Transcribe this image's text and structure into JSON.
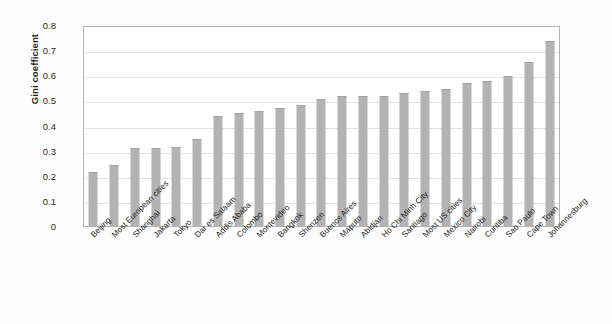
{
  "chart_data": {
    "type": "bar",
    "title": "",
    "xlabel": "",
    "ylabel": "Gini coefficient",
    "ylim": [
      0,
      0.8
    ],
    "ytick_labels": [
      "0.8",
      "0.7",
      "0.6",
      "0.5",
      "0.4",
      "0.3",
      "0.2",
      "0.1",
      "0"
    ],
    "ytick_values": [
      0.8,
      0.7,
      0.6,
      0.5,
      0.4,
      0.3,
      0.2,
      0.1,
      0
    ],
    "grid": true,
    "legend": null,
    "bar_color": "#b3b3b3",
    "categories": [
      "Beijing",
      "Most European cities",
      "Shanghai",
      "Jakarta",
      "Tokyo",
      "Dar es Salaam",
      "Addis Ababa",
      "Colombo",
      "Montevideo",
      "Bangkok",
      "Shenzen",
      "Buenos Aires",
      "Maputo",
      "Abidjan",
      "Ho Chi Minh City",
      "Santiago",
      "Most US cities",
      "Mexico City",
      "Nairobi",
      "Curitiba",
      "Sao Paulo",
      "Cape Town",
      "Johannesburg"
    ],
    "values": [
      0.22,
      0.245,
      0.315,
      0.315,
      0.32,
      0.35,
      0.44,
      0.455,
      0.46,
      0.475,
      0.485,
      0.51,
      0.52,
      0.52,
      0.52,
      0.535,
      0.54,
      0.55,
      0.575,
      0.58,
      0.6,
      0.655,
      0.74
    ]
  }
}
